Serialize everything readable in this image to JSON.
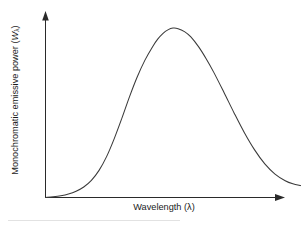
{
  "figure": {
    "background_color": "#ffffff",
    "curve_color": "#3a3a3a",
    "axis_color": "#2a2a2a",
    "y_axis_label_prefix": "Monochromatic emissive power (",
    "y_axis_label_symbol": "W",
    "y_axis_label_subscript": "λ",
    "y_axis_label_suffix": ")",
    "x_axis_label": "Wavelength (λ)"
  },
  "chart_data": {
    "type": "line",
    "title": "",
    "subtitle": "",
    "xlabel": "Wavelength (λ)",
    "ylabel": "Monochromatic emissive power (Wλ)",
    "grid": false,
    "legend": false,
    "legend_position": "none",
    "axis_arrows": true,
    "tick_labels_x": [],
    "tick_labels_y": [],
    "xlim": [
      0,
      1
    ],
    "ylim": [
      0,
      1
    ],
    "series": [
      {
        "name": "Spectral blackbody emissive power",
        "x": [
          0.0,
          0.03,
          0.06,
          0.09,
          0.12,
          0.15,
          0.18,
          0.21,
          0.24,
          0.27,
          0.3,
          0.33,
          0.36,
          0.39,
          0.42,
          0.44,
          0.46,
          0.48,
          0.5,
          0.52,
          0.545,
          0.57,
          0.6,
          0.63,
          0.66,
          0.7,
          0.74,
          0.78,
          0.82,
          0.86,
          0.9,
          0.94,
          0.97,
          1.0
        ],
        "y": [
          0.0,
          0.004,
          0.01,
          0.02,
          0.036,
          0.06,
          0.098,
          0.155,
          0.235,
          0.338,
          0.455,
          0.578,
          0.69,
          0.785,
          0.862,
          0.905,
          0.937,
          0.958,
          0.968,
          0.965,
          0.948,
          0.918,
          0.862,
          0.793,
          0.715,
          0.6,
          0.482,
          0.37,
          0.272,
          0.192,
          0.134,
          0.096,
          0.078,
          0.068
        ]
      }
    ],
    "annotations": [
      {
        "label": "peak",
        "x": 0.508,
        "y": 0.969
      },
      {
        "label": "origin",
        "x": 0.0,
        "y": 0.0
      }
    ]
  }
}
